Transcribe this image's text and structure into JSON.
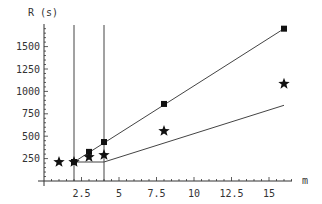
{
  "chart_data": {
    "type": "line",
    "title": "",
    "xlabel": "m",
    "ylabel": "R (s)",
    "xlim": [
      0,
      17
    ],
    "ylim": [
      0,
      1750
    ],
    "x_ticks": [
      2.5,
      5,
      7.5,
      10,
      12.5,
      15
    ],
    "x_tick_labels": [
      "2.5",
      "5",
      "7.5",
      "10",
      "12.5",
      "15"
    ],
    "y_ticks": [
      250,
      500,
      750,
      1000,
      1250,
      1500
    ],
    "y_tick_labels": [
      "250",
      "500",
      "750",
      "1000",
      "1250",
      "1500"
    ],
    "grid": false,
    "legend": null,
    "vertical_lines": [
      2,
      4
    ],
    "series": [
      {
        "name": "upper bound (squares)",
        "marker": "square",
        "points": [
          [
            2,
            212
          ],
          [
            3,
            325
          ],
          [
            4,
            435
          ],
          [
            8,
            860
          ],
          [
            16,
            1700
          ]
        ],
        "line": [
          [
            2,
            212
          ],
          [
            16,
            1700
          ]
        ]
      },
      {
        "name": "measured (stars)",
        "marker": "star",
        "points": [
          [
            1,
            212
          ],
          [
            2,
            212
          ],
          [
            3,
            268
          ],
          [
            4,
            290
          ],
          [
            8,
            558
          ],
          [
            16,
            1085
          ]
        ],
        "line": null
      },
      {
        "name": "lower bound",
        "marker": "none",
        "points": [],
        "line": [
          [
            2,
            212
          ],
          [
            4,
            212
          ],
          [
            16,
            845
          ]
        ]
      }
    ],
    "colors": {
      "axis": "#333333",
      "line": "#444444",
      "marker": "#111111"
    }
  }
}
